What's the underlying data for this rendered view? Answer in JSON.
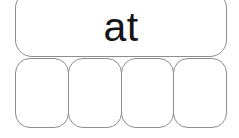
{
  "canvas": {
    "width": 239,
    "height": 138,
    "background_color": "#ffffff"
  },
  "style": {
    "box_border_color": "#8d8d8d",
    "box_fill_color": "#ffffff",
    "text_color": "#141414"
  },
  "word_box": {
    "word": "at",
    "letter_count": 2
  },
  "letter_boxes": {
    "count": 4,
    "cells": [
      {
        "label": ""
      },
      {
        "label": ""
      },
      {
        "label": ""
      },
      {
        "label": ""
      }
    ]
  }
}
